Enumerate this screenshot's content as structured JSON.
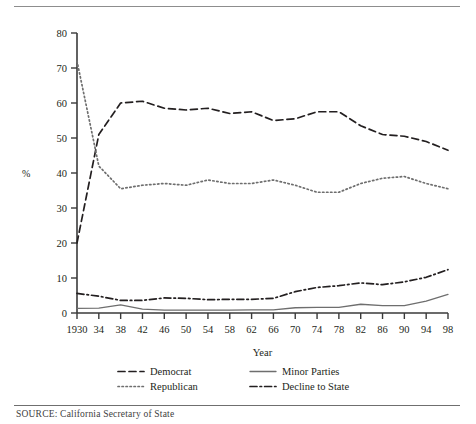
{
  "figure": {
    "source_note": "SOURCE: California Secretary of State",
    "axis_x_title": "Year",
    "axis_y_title": "%"
  },
  "legend": {
    "items": [
      {
        "label": "Democrat",
        "style": "dashed",
        "color": "#231f20"
      },
      {
        "label": "Republican",
        "style": "dotted",
        "color": "#6e6e6e"
      },
      {
        "label": "Minor Parties",
        "style": "solid",
        "color": "#6e6e6e"
      },
      {
        "label": "Decline to State",
        "style": "dashdot",
        "color": "#231f20"
      }
    ]
  },
  "chart_data": {
    "type": "line",
    "title": "",
    "xlabel": "Year",
    "ylabel": "%",
    "xlim": [
      1930,
      1998
    ],
    "ylim": [
      0,
      80
    ],
    "yticks": [
      0,
      10,
      20,
      30,
      40,
      50,
      60,
      70,
      80
    ],
    "grid": false,
    "legend_position": "bottom",
    "x": [
      1930,
      1934,
      1938,
      1942,
      1946,
      1950,
      1954,
      1958,
      1962,
      1966,
      1970,
      1974,
      1978,
      1982,
      1986,
      1990,
      1994,
      1998
    ],
    "xtick_labels": [
      "1930",
      "34",
      "38",
      "42",
      "46",
      "50",
      "54",
      "58",
      "62",
      "66",
      "70",
      "74",
      "78",
      "82",
      "86",
      "90",
      "94",
      "98"
    ],
    "series": [
      {
        "name": "Democrat",
        "style": "dashed",
        "color": "#231f20",
        "values": [
          20,
          51,
          60,
          60.5,
          58.5,
          58,
          58.5,
          57,
          57.5,
          55,
          55.5,
          57.5,
          57.5,
          53.5,
          51,
          50.5,
          49,
          46.5
        ]
      },
      {
        "name": "Republican",
        "style": "dotted",
        "color": "#6e6e6e",
        "values": [
          72,
          42,
          35.5,
          36.5,
          37,
          36.5,
          38,
          37,
          37,
          38,
          36.5,
          34.5,
          34.5,
          37,
          38.5,
          39,
          37,
          35.5
        ]
      },
      {
        "name": "Minor Parties",
        "style": "solid",
        "color": "#6e6e6e",
        "values": [
          1.3,
          1.4,
          2.3,
          1.1,
          0.8,
          0.8,
          0.8,
          0.8,
          0.9,
          0.9,
          1.5,
          1.6,
          1.6,
          2.5,
          2.1,
          2.1,
          3.4,
          5.3
        ]
      },
      {
        "name": "Decline to State",
        "style": "dashdot",
        "color": "#231f20",
        "values": [
          5.6,
          4.8,
          3.6,
          3.6,
          4.3,
          4.2,
          3.8,
          3.9,
          3.9,
          4.2,
          6.1,
          7.3,
          7.8,
          8.6,
          8.1,
          8.9,
          10.2,
          12.4
        ]
      }
    ]
  }
}
